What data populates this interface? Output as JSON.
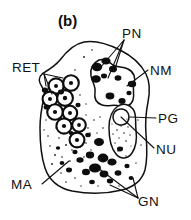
{
  "figure": {
    "panel_label": "(b)",
    "caption_type": "cell ultrastructure line drawing",
    "background_color": "#ffffff",
    "ink_color": "#101010",
    "width": 191,
    "height": 220
  },
  "labels": [
    {
      "key": "RET",
      "text": "RET",
      "meaning": "rough endoplasmic reticulum",
      "x": 12,
      "y": 72,
      "anchor": "start",
      "leaders": 3
    },
    {
      "key": "PN",
      "text": "PN",
      "meaning": "perinuclear dense material",
      "x": 122,
      "y": 38,
      "anchor": "start",
      "leaders": 2
    },
    {
      "key": "NM",
      "text": "NM",
      "meaning": "nuclear membrane",
      "x": 150,
      "y": 75,
      "anchor": "start",
      "leaders": 1
    },
    {
      "key": "PG",
      "text": "PG",
      "meaning": "pigment granule",
      "x": 158,
      "y": 123,
      "anchor": "start",
      "leaders": 1
    },
    {
      "key": "NU",
      "text": "NU",
      "meaning": "nucleolus",
      "x": 156,
      "y": 154,
      "anchor": "start",
      "leaders": 1
    },
    {
      "key": "MA",
      "text": "MA",
      "meaning": "matrix",
      "x": 11,
      "y": 189,
      "anchor": "start",
      "leaders": 1
    },
    {
      "key": "GN",
      "text": "GN",
      "meaning": "granules",
      "x": 138,
      "y": 206,
      "anchor": "start",
      "leaders": 2
    }
  ],
  "structures": {
    "cell_body": {
      "name": "cell outline",
      "description": "irregular rounded cell profile occupying the centre of the panel"
    },
    "nucleus": {
      "name": "nucleus",
      "description": "irregular lobed body in the upper right of the cell, bounded by the nuclear membrane and studded with dense perinuclear patches"
    },
    "pigment_granule": {
      "name": "pigment granule",
      "description": "elongated crescent organelle on the right side with stippled interior and a small pale nucleolus lobe at its top"
    },
    "vesicles": {
      "name": "rough endoplasmic reticulum vesicles",
      "count": 9,
      "description": "chain of ringed vesicles with dark centres along the left flank"
    },
    "granules": {
      "name": "dense granules",
      "count": 18,
      "description": "irregular solid black granules clustered in the lower half of the cytoplasm"
    },
    "matrix": {
      "name": "matrix",
      "description": "stippled cytoplasmic ground substance filling the cell interior"
    }
  }
}
